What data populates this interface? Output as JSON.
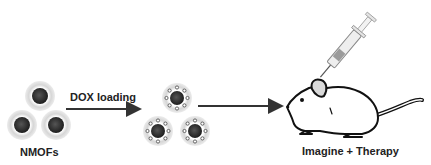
{
  "diagram": {
    "steps": [
      {
        "label": "NMOFs"
      },
      {
        "label": "DOX loading"
      },
      {
        "label": "Imagine + Therapy"
      }
    ],
    "colors": {
      "core": "#2a2a2a",
      "halo": "#d4d4d4",
      "line": "#333333",
      "mouse_ear": "#d9d9d9"
    }
  }
}
